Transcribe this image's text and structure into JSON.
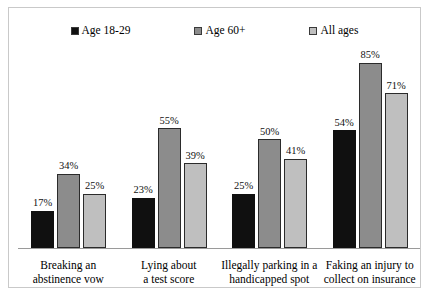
{
  "chart_data": {
    "type": "bar",
    "title": "",
    "xlabel": "",
    "ylabel": "",
    "ylim": [
      0,
      95
    ],
    "grid": false,
    "legend_position": "top",
    "value_labels": true,
    "categories": [
      "Breaking an\nabstinence vow",
      "Lying about\na test score",
      "Illegally parking in a\nhandicapped spot",
      "Faking an injury to\ncollect on insurance"
    ],
    "category_lines": [
      [
        "Breaking an",
        "abstinence vow"
      ],
      [
        "Lying about",
        "a test score"
      ],
      [
        "Illegally parking in a",
        "handicapped spot"
      ],
      [
        "Faking an injury to",
        "collect on insurance"
      ]
    ],
    "series": [
      {
        "name": "Age 18-29",
        "color": "#101010",
        "values": [
          17,
          23,
          25,
          54
        ],
        "labels": [
          "17%",
          "23%",
          "25%",
          "54%"
        ]
      },
      {
        "name": "Age 60+",
        "color": "#8c8c8c",
        "values": [
          34,
          55,
          50,
          85
        ],
        "labels": [
          "34%",
          "55%",
          "50%",
          "85%"
        ]
      },
      {
        "name": "All ages",
        "color": "#bfbfbf",
        "values": [
          25,
          39,
          41,
          71
        ],
        "labels": [
          "25%",
          "39%",
          "41%",
          "71%"
        ]
      }
    ]
  },
  "legend": {
    "entries": [
      {
        "label": "Age 18-29",
        "color": "#101010"
      },
      {
        "label": "Age 60+",
        "color": "#8c8c8c"
      },
      {
        "label": "All ages",
        "color": "#bfbfbf"
      }
    ]
  }
}
